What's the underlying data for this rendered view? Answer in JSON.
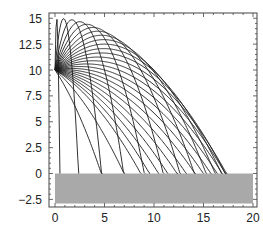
{
  "chart_data": {
    "type": "line",
    "title": "",
    "xlabel": "",
    "ylabel": "",
    "xlim": [
      -0.6,
      20.3
    ],
    "ylim": [
      -3.3,
      15.5
    ],
    "grid": false,
    "legend": null,
    "x_ticks": [
      "0",
      "5",
      "10",
      "15",
      "20"
    ],
    "x_tick_values": [
      0,
      5,
      10,
      15,
      20
    ],
    "y_ticks": [
      "15",
      "12.5",
      "10",
      "7.5",
      "5",
      "2.5",
      "0",
      "-2.5"
    ],
    "y_tick_values": [
      15,
      12.5,
      10,
      7.5,
      5,
      2.5,
      0,
      -2.5
    ],
    "launch_point": [
      0,
      10
    ],
    "speed_squared_over_g": 10,
    "angles_deg": [
      -55,
      -40,
      -30,
      -25,
      -20,
      -15,
      -10,
      -5,
      0,
      5,
      10,
      15,
      20,
      25,
      30,
      35,
      40,
      45,
      50,
      55,
      60,
      65,
      70,
      75,
      80,
      85,
      89
    ],
    "ground": {
      "x": [
        0,
        20
      ],
      "y": [
        -2.9,
        0
      ],
      "color": "#a9a9a9"
    },
    "line_color": "#1a1a1a",
    "frame_color": "#444444"
  }
}
